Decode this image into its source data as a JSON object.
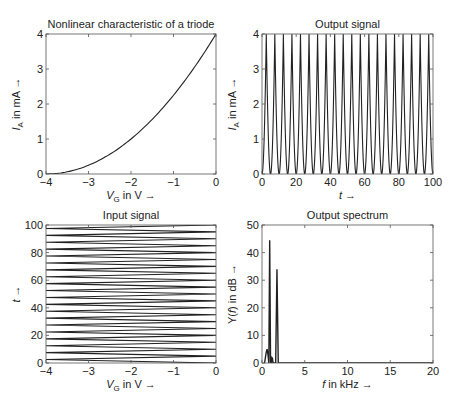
{
  "chart_data": [
    {
      "id": "triode",
      "type": "line",
      "title": "Nonlinear characteristic of a triode",
      "xlabel": "V_G in V →",
      "ylabel": "I_A in mA →",
      "xlim": [
        -4,
        0
      ],
      "ylim": [
        0,
        4
      ],
      "xticks": [
        -4,
        -3,
        -2,
        -1,
        0
      ],
      "yticks": [
        0,
        1,
        2,
        3,
        4
      ],
      "series": [
        {
          "name": "I_A = 0.25*(V_G+4)^2",
          "x": [
            -4,
            -3.5,
            -3,
            -2.5,
            -2,
            -1.5,
            -1,
            -0.5,
            0
          ],
          "y": [
            0,
            0.06,
            0.25,
            0.56,
            1.0,
            1.56,
            2.25,
            3.06,
            4.0
          ]
        }
      ],
      "grid": false
    },
    {
      "id": "output-signal",
      "type": "line",
      "title": "Output signal",
      "xlabel": "t →",
      "ylabel": "I_A in mA →",
      "xlim": [
        0,
        100
      ],
      "ylim": [
        0,
        4
      ],
      "xticks": [
        0,
        20,
        40,
        60,
        80,
        100
      ],
      "yticks": [
        0,
        1,
        2,
        3,
        4
      ],
      "period": 5,
      "min": 0,
      "max": 4,
      "grid": false
    },
    {
      "id": "input-signal",
      "type": "line",
      "title": "Input signal",
      "xlabel": "V_G in V →",
      "ylabel": "t →",
      "xlim": [
        -4,
        0
      ],
      "ylim": [
        0,
        100
      ],
      "xticks": [
        -4,
        -3,
        -2,
        -1,
        0
      ],
      "yticks": [
        0,
        20,
        40,
        60,
        80,
        100
      ],
      "period": 5,
      "min": -4,
      "max": 0,
      "grid": false
    },
    {
      "id": "output-spectrum",
      "type": "line",
      "title": "Output spectrum",
      "xlabel": "f in kHz →",
      "ylabel": "Y(f) in dB →",
      "xlim": [
        0,
        20
      ],
      "ylim": [
        0,
        50
      ],
      "xticks": [
        0,
        5,
        10,
        15,
        20
      ],
      "yticks": [
        0,
        10,
        20,
        30,
        40,
        50
      ],
      "series": [
        {
          "name": "spectrum",
          "x": [
            0.3,
            0.5,
            0.6,
            0.7,
            0.8,
            0.9,
            1.0,
            1.05,
            1.1,
            1.2,
            1.3,
            1.6,
            1.75,
            1.9,
            20
          ],
          "y": [
            0,
            4,
            5,
            3,
            0,
            44.5,
            0,
            2.5,
            0,
            2,
            0,
            0,
            34,
            0,
            0
          ]
        }
      ],
      "grid": false
    }
  ]
}
